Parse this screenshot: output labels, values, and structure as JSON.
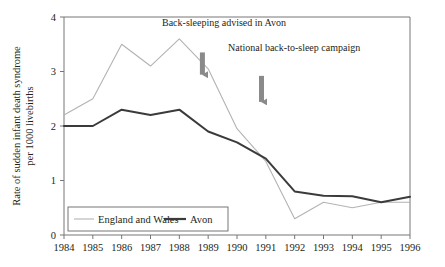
{
  "chart_data": {
    "type": "line",
    "title": "",
    "xlabel": "",
    "ylabel": "Rate of sudden infant death syndrome per 1000 livebirths",
    "ylabel_line1": "Rate of sudden infant death syndrome",
    "ylabel_line2": "per 1000 livebirths",
    "categories": [
      "1984",
      "1985",
      "1986",
      "1987",
      "1988",
      "1989",
      "1990",
      "1991",
      "1992",
      "1993",
      "1994",
      "1995",
      "1996"
    ],
    "x": [
      1984,
      1985,
      1986,
      1987,
      1988,
      1989,
      1990,
      1991,
      1992,
      1993,
      1994,
      1995,
      1996
    ],
    "xlim": [
      1984,
      1996
    ],
    "ylim": [
      0,
      4
    ],
    "yticks": [
      "0",
      "1",
      "2",
      "3",
      "4"
    ],
    "ytick_values": [
      0,
      1,
      2,
      3,
      4
    ],
    "grid": false,
    "legend_position": "bottom-left",
    "series": [
      {
        "name": "England and Wales",
        "color": "#b3b3b3",
        "values": [
          2.2,
          2.5,
          3.5,
          3.1,
          3.6,
          3.05,
          1.95,
          1.35,
          0.3,
          0.6,
          0.5,
          0.6,
          0.6
        ]
      },
      {
        "name": "Avon",
        "color": "#3b3b3b",
        "values": [
          2.0,
          2.0,
          2.3,
          2.2,
          2.3,
          1.9,
          1.7,
          1.4,
          0.8,
          0.72,
          0.71,
          0.6,
          0.7
        ]
      }
    ],
    "annotations": [
      {
        "label": "Back-sleeping advised in Avon",
        "arrow_x": 1988.8,
        "arrow_top": 3.35,
        "arrow_bottom": 2.85
      },
      {
        "label": "National back-to-sleep campaign",
        "arrow_x": 1990.85,
        "arrow_top": 2.92,
        "arrow_bottom": 2.35
      }
    ],
    "legend": [
      {
        "label": "England and Wales",
        "color": "#b3b3b3",
        "width": 1.1
      },
      {
        "label": "Avon",
        "color": "#3b3b3b",
        "width": 2.2
      }
    ]
  }
}
